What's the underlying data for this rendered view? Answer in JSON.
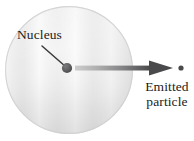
{
  "figure": {
    "background_color": "#ffffff",
    "width": 194,
    "height": 141
  },
  "atom": {
    "name": "atom-sphere",
    "center_x": 69,
    "center_y": 70,
    "radius": 64,
    "fill_light": "#f4f4f4",
    "fill_mid": "#e6e6e6",
    "fill_edge": "#d2d2d2"
  },
  "nucleus": {
    "label": "Nucleus",
    "center_x": 67,
    "center_y": 68,
    "radius": 5,
    "color": "#59595b",
    "leader_line": {
      "x1": 42,
      "y1": 46,
      "x2": 65,
      "y2": 66,
      "color": "#3a3a3c",
      "width": 1.4
    }
  },
  "emission": {
    "label_line1": "Emitted",
    "label_line2": "particle",
    "arrow": {
      "shaft_x1": 75,
      "shaft_x2": 150,
      "shaft_y": 68,
      "shaft_thickness": 5,
      "head_tip_x": 173,
      "head_back_x": 149,
      "head_half_height": 7.5,
      "color_start": "#c9c9c9",
      "color_end": "#4a4a4c"
    },
    "particle": {
      "center_x": 181,
      "center_y": 68,
      "radius": 2.6,
      "color": "#4a4a4c"
    }
  }
}
